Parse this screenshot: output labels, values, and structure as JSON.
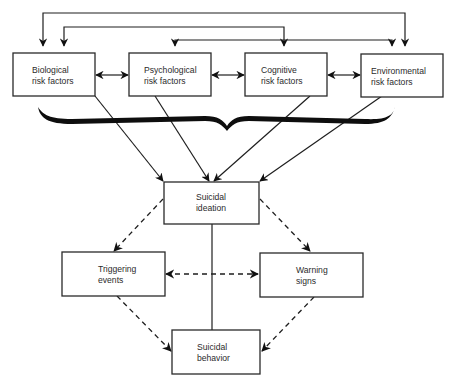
{
  "diagram": {
    "type": "flow-diagram",
    "risk_factor_boxes": [
      {
        "id": "biological",
        "line1": "Biological",
        "line2": "risk factors"
      },
      {
        "id": "psychological",
        "line1": "Psychological",
        "line2": "risk factors"
      },
      {
        "id": "cognitive",
        "line1": "Cognitive",
        "line2": "risk factors"
      },
      {
        "id": "environmental",
        "line1": "Environmental",
        "line2": "risk factors"
      }
    ],
    "ideation_box": {
      "line1": "Suicidal",
      "line2": "ideation"
    },
    "triggering_box": {
      "line1": "Triggering",
      "line2": "events"
    },
    "warning_box": {
      "line1": "Warning",
      "line2": "signs"
    },
    "behavior_box": {
      "line1": "Suicidal",
      "line2": "behavior"
    },
    "connections": [
      {
        "from": "biological",
        "to": "psychological",
        "style": "solid",
        "direction": "bidirectional"
      },
      {
        "from": "psychological",
        "to": "cognitive",
        "style": "solid",
        "direction": "bidirectional"
      },
      {
        "from": "cognitive",
        "to": "environmental",
        "style": "solid",
        "direction": "bidirectional"
      },
      {
        "from": "biological",
        "to": "environmental",
        "style": "solid",
        "direction": "bidirectional",
        "route": "top"
      },
      {
        "from": "biological",
        "to": "cognitive",
        "style": "solid",
        "direction": "bidirectional",
        "route": "top"
      },
      {
        "from": "psychological",
        "to": "environmental",
        "style": "solid",
        "direction": "bidirectional",
        "route": "top"
      },
      {
        "from": "biological",
        "to": "ideation",
        "style": "solid",
        "direction": "forward"
      },
      {
        "from": "psychological",
        "to": "ideation",
        "style": "solid",
        "direction": "forward"
      },
      {
        "from": "cognitive",
        "to": "ideation",
        "style": "solid",
        "direction": "forward"
      },
      {
        "from": "environmental",
        "to": "ideation",
        "style": "solid",
        "direction": "forward"
      },
      {
        "from": "ideation",
        "to": "triggering",
        "style": "dashed",
        "direction": "forward"
      },
      {
        "from": "ideation",
        "to": "warning",
        "style": "dashed",
        "direction": "forward"
      },
      {
        "from": "triggering",
        "to": "warning",
        "style": "dashed",
        "direction": "bidirectional"
      },
      {
        "from": "ideation",
        "to": "behavior",
        "style": "solid",
        "direction": "none"
      },
      {
        "from": "triggering",
        "to": "behavior",
        "style": "dashed",
        "direction": "forward"
      },
      {
        "from": "warning",
        "to": "behavior",
        "style": "dashed",
        "direction": "forward"
      }
    ],
    "brace": "groups all four risk factor boxes"
  }
}
